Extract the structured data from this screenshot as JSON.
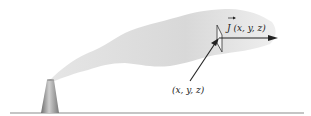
{
  "diagram": {
    "labels": {
      "flux_symbol": "J",
      "flux_args": "(x, y, z)",
      "point": "(x, y, z)"
    },
    "colors": {
      "plume": "#dcdcdc",
      "stack_light": "#c8c8c8",
      "stack_dark": "#7a7a7a",
      "ground": "#8c8c8c",
      "arrow": "#222222"
    },
    "elements": [
      "smokestack",
      "smoke-plume",
      "ground-line",
      "flux-vector-arrow",
      "surface-element",
      "position-vector-arrow"
    ]
  }
}
